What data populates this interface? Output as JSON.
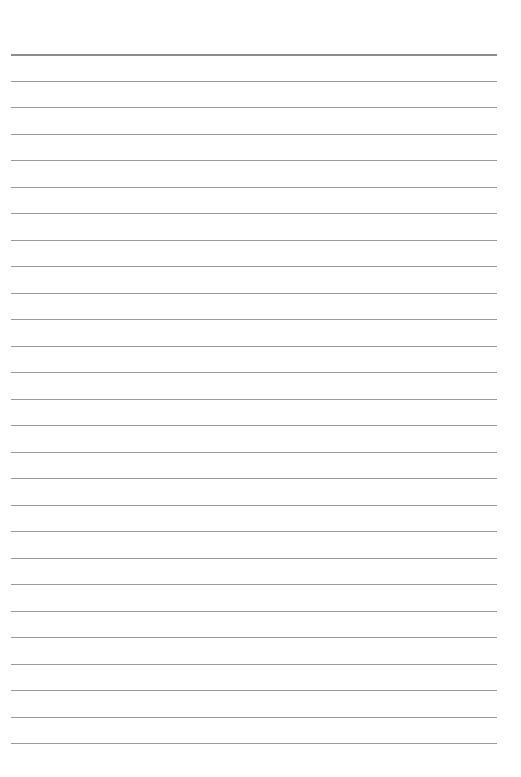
{
  "document": {
    "type": "lined-paper",
    "line_count": 27,
    "first_line_y": 54,
    "line_spacing": 26.5,
    "line_color": "#9a9a9a",
    "header_line_color": "#8c8c8c",
    "background": "#ffffff"
  }
}
